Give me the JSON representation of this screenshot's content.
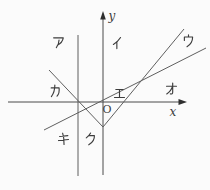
{
  "figure": {
    "axis_labels": {
      "x": "x",
      "y": "y",
      "origin": "O"
    },
    "region_labels": {
      "a": "ア",
      "i": "イ",
      "u": "ウ",
      "e": "エ",
      "o": "オ",
      "ka": "カ",
      "ki": "キ",
      "ku": "ク"
    },
    "elements": [
      "x-axis",
      "y-axis",
      "vertical-line",
      "v-shaped-graph-left-branch",
      "v-shaped-graph-right-branch",
      "ascending-slanted-line"
    ],
    "colors": {
      "line": "#5f5f5f",
      "axis": "#4a4a4a",
      "label": "#3d3d3d",
      "background": "#fbfbfb"
    }
  }
}
